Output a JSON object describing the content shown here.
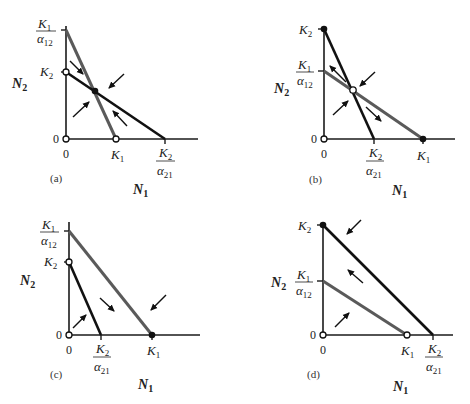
{
  "figure": {
    "type": "Lotka-Volterra competition phase-plane isoclines",
    "x_axis_label": "N₁",
    "y_axis_label": "N₂",
    "origin_label": "0",
    "colors": {
      "species1_isocline": "#5a5a5a",
      "species2_isocline": "#111111",
      "axis": "#1a1a1a"
    }
  },
  "labels": {
    "N": "N",
    "sub1": "1",
    "sub2": "2",
    "K": "K",
    "alpha": "α",
    "sub12": "12",
    "sub21": "21",
    "zero": "0"
  },
  "panels": [
    {
      "caption": "(a)",
      "outcome": "stable coexistence",
      "y_ticks": [
        "K1/α12",
        "K2"
      ],
      "x_ticks": [
        "0",
        "K1",
        "K2/α21"
      ],
      "equilibrium_interior": "stable (filled)",
      "arrows": "converge toward intersection"
    },
    {
      "caption": "(b)",
      "outcome": "unstable equilibrium; either species wins",
      "y_ticks": [
        "K2",
        "K1/α12"
      ],
      "x_ticks": [
        "0",
        "K2/α21",
        "K1"
      ],
      "equilibrium_interior": "unstable (open)",
      "arrows": "diverge away from intersection"
    },
    {
      "caption": "(c)",
      "outcome": "species 1 wins",
      "y_ticks": [
        "K1/α12",
        "K2"
      ],
      "x_ticks": [
        "0",
        "K2/α21",
        "K1"
      ],
      "equilibrium_stable": "K1 on N1 axis (filled)"
    },
    {
      "caption": "(d)",
      "outcome": "species 2 wins",
      "y_ticks": [
        "K2",
        "K1/α12"
      ],
      "x_ticks": [
        "0",
        "K1",
        "K2/α21"
      ],
      "equilibrium_stable": "K2 on N2 axis (filled)"
    }
  ],
  "captions": {
    "a": "(a)",
    "b": "(b)",
    "c": "(c)",
    "d": "(d)"
  }
}
